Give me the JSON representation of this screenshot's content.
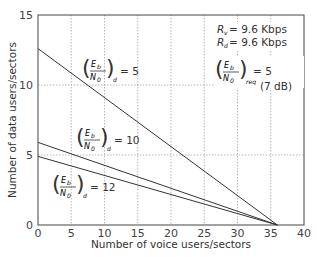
{
  "chart_data": {
    "type": "line",
    "title": "",
    "xlabel": "Number of voice users/sectors",
    "ylabel": "Number of data users/sectors",
    "xlim": [
      0,
      40
    ],
    "ylim": [
      0,
      15
    ],
    "xticks": [
      "0",
      "5",
      "10",
      "15",
      "20",
      "25",
      "30",
      "35",
      "40"
    ],
    "yticks": [
      "0",
      "5",
      "10",
      "15"
    ],
    "grid": true,
    "series": [
      {
        "name": "(Eb/N0)d = 5",
        "x": [
          0,
          36
        ],
        "y": [
          12.6,
          0
        ]
      },
      {
        "name": "(Eb/N0)d = 10",
        "x": [
          0,
          36
        ],
        "y": [
          5.9,
          0
        ]
      },
      {
        "name": "(Eb/N0)d = 12",
        "x": [
          0,
          36
        ],
        "y": [
          4.9,
          0
        ]
      }
    ],
    "annotations": {
      "rv": "Rv = 9.6 Kbps",
      "rd": "Rd = 9.6 Kbps",
      "req": "(Eb/N0)req = 5",
      "req_db": "(7 dB)"
    }
  },
  "labels": {
    "series1_value": "= 5",
    "series2_value": "= 10",
    "series3_value": "= 12",
    "E": "E",
    "b": "b",
    "N": "N",
    "zero": "0",
    "d": "d",
    "req_sub": "req",
    "rv_R": "R",
    "rv_sub": "v",
    "rv_val": "= 9.6 Kbps",
    "rd_R": "R",
    "rd_sub": "d",
    "rd_val": "= 9.6 Kbps",
    "req_value": "= 5",
    "req_db": "(7 dB)"
  }
}
